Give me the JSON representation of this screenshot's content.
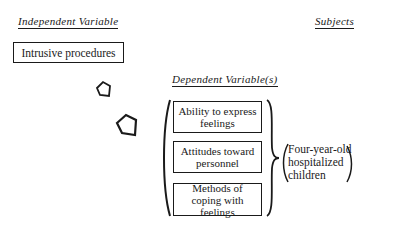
{
  "independent": {
    "heading": "Independent Variable",
    "variable": "Intrusive procedures"
  },
  "dependent": {
    "heading": "Dependent Variable(s)",
    "variables": [
      "Ability to express feelings",
      "Attitudes toward personnel",
      "Methods of coping with feelings"
    ]
  },
  "subjects": {
    "heading": "Subjects",
    "lines": [
      "Four-year-old",
      "hospitalized",
      "children"
    ]
  },
  "icons": {
    "arrows": [
      "arrow-small-icon",
      "arrow-large-icon"
    ]
  }
}
